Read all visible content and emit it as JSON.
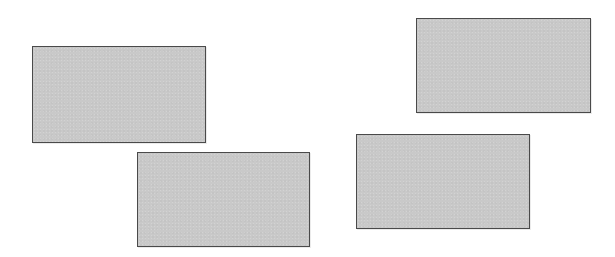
{
  "diagram": {
    "background": "#ffffff",
    "shape_fill": "#c9c9c9",
    "shape_border": "#4a4a4a",
    "shapes": [
      {
        "type": "rectangle",
        "x": 32,
        "y": 46,
        "width": 174,
        "height": 97
      },
      {
        "type": "rectangle",
        "x": 137,
        "y": 152,
        "width": 173,
        "height": 95
      },
      {
        "type": "rectangle",
        "x": 416,
        "y": 18,
        "width": 175,
        "height": 95
      },
      {
        "type": "rectangle",
        "x": 356,
        "y": 134,
        "width": 174,
        "height": 95
      }
    ]
  }
}
